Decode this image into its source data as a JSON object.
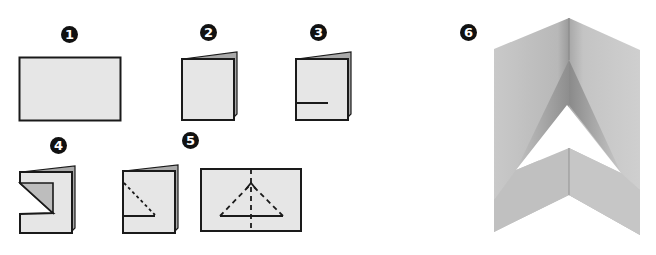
{
  "colors": {
    "paper": "#e6e6e6",
    "paper_back": "#a9a9a9",
    "outline": "#1a1a1a",
    "fold_shadow": "#bdbdbd",
    "final_light": "#d2d2d2",
    "final_dark": "#9c9c9c"
  },
  "steps": [
    {
      "number": "1",
      "description": "flat rectangular sheet"
    },
    {
      "number": "2",
      "description": "sheet folded in half"
    },
    {
      "number": "3",
      "description": "cut a horizontal slit"
    },
    {
      "number": "4",
      "description": "fold flap back diagonally"
    },
    {
      "number": "5",
      "description": "unfold; crease lines form triangle with dashed fold lines"
    },
    {
      "number": "6",
      "description": "finished pop-up arrow stand"
    }
  ]
}
